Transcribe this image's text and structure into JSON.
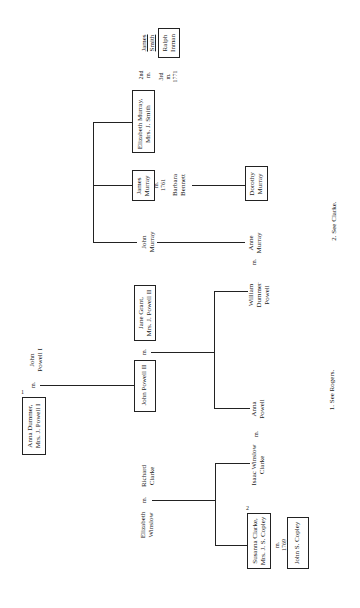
{
  "people": {
    "anna_dummer": {
      "line1": "Anna Dummer,",
      "line2": "Mrs. J. Powell I",
      "note": "1"
    },
    "john_powell_1": {
      "line1": "John",
      "line2": "Powell I"
    },
    "john_powell_2": {
      "line1": "John Powell II"
    },
    "jane_grant": {
      "line1": "Jane Grant,",
      "line2": "Mrs. J. Powell II"
    },
    "william_dummer_powell": {
      "line1": "William",
      "line2": "Dummer",
      "line3": "Powell"
    },
    "anna_powell": {
      "line1": "Anna",
      "line2": "Powell"
    },
    "john_murray": {
      "line1": "John",
      "line2": "Murray"
    },
    "anne_murray": {
      "line1": "Anne",
      "line2": "Murray"
    },
    "james_murray": {
      "line1": "James",
      "line2": "Murray"
    },
    "barbara_bennett": {
      "line1": "Barbara",
      "line2": "Bennett"
    },
    "dorothy_murray": {
      "line1": "Dorothy",
      "line2": "Murray"
    },
    "elizabeth_murray": {
      "line1": "Elizabeth Murray,",
      "line2": "Mrs. J. Smith"
    },
    "james_smith": {
      "line1": "James",
      "line2": "Smith"
    },
    "ralph_inman": {
      "line1": "Ralph",
      "line2": "Inman"
    },
    "richard_clarke": {
      "line1": "Richard",
      "line2": "Clarke"
    },
    "elizabeth_winslow": {
      "line1": "Elizabeth",
      "line2": "Winslow"
    },
    "isaac_winslow_clarke": {
      "line1": "Isaac Winslow",
      "line2": "Clarke"
    },
    "susanna_clarke": {
      "line1": "Susanna Clarke,",
      "line2": "Mrs. J. S. Copley",
      "note": "2"
    },
    "john_s_copley": {
      "line1": "John S. Copley"
    }
  },
  "marriages": {
    "powell1": "m.",
    "powell2": "m.",
    "william_anne": "m.",
    "anna_powell": "m.",
    "james_murray": {
      "line1": "m.",
      "line2": "1761"
    },
    "smith_2nd": {
      "line1": "2nd",
      "line2": "m."
    },
    "inman_3rd": {
      "line1": "3rd",
      "line2": "m.",
      "line3": "1771"
    },
    "clarke": "m.",
    "copley": {
      "line1": "m.",
      "line2": "1769"
    }
  },
  "footnotes": {
    "one": "1. See Rogers.",
    "two": "2. See Clarke."
  }
}
